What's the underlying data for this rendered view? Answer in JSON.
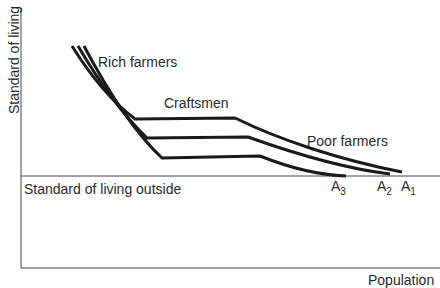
{
  "axes": {
    "y_label": "Standard of living",
    "x_label": "Population"
  },
  "labels": {
    "rich_farmers": "Rich farmers",
    "craftsmen": "Craftsmen",
    "poor_farmers": "Poor farmers",
    "outside": "Standard of living outside"
  },
  "endpoints": [
    {
      "base": "A",
      "sub": "3"
    },
    {
      "base": "A",
      "sub": "2"
    },
    {
      "base": "A",
      "sub": "1"
    }
  ],
  "colors": {
    "line": "#1a1a1a",
    "axis": "#444444",
    "text": "#2a2a2a"
  }
}
